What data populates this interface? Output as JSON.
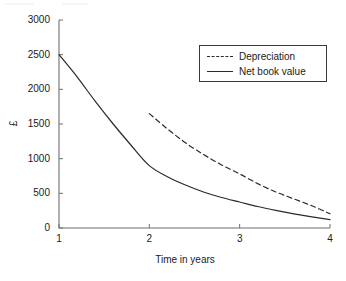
{
  "chart_data": {
    "type": "line",
    "title": "",
    "xlabel": "Time in years",
    "ylabel": "£",
    "xlim": [
      1,
      4
    ],
    "ylim": [
      0,
      3000
    ],
    "ytick_labels": [
      "0",
      "500",
      "1000",
      "1500",
      "2000",
      "2500",
      "3000"
    ],
    "ytick_values": [
      0,
      500,
      1000,
      1500,
      2000,
      2500,
      3000
    ],
    "xtick_labels": [
      "1",
      "2",
      "3",
      "4"
    ],
    "xtick_values": [
      1,
      2,
      3,
      4
    ],
    "grid": false,
    "legend_position": "upper right",
    "series": [
      {
        "name": "Depreciation",
        "style": "dashed",
        "color": "#2b2b2b",
        "x": [
          2,
          2.2,
          2.4,
          2.6,
          2.8,
          3,
          3.2,
          3.4,
          3.6,
          3.8,
          4
        ],
        "values": [
          1650,
          1430,
          1230,
          1060,
          910,
          780,
          640,
          520,
          420,
          320,
          205
        ]
      },
      {
        "name": "Net book value",
        "style": "solid",
        "color": "#2b2b2b",
        "x": [
          1,
          1.2,
          1.4,
          1.6,
          1.8,
          2,
          2.2,
          2.4,
          2.6,
          2.8,
          3,
          3.2,
          3.4,
          3.6,
          3.8,
          4
        ],
        "values": [
          2500,
          2180,
          1830,
          1500,
          1190,
          900,
          740,
          620,
          520,
          440,
          375,
          310,
          255,
          205,
          160,
          120
        ]
      }
    ],
    "legend_entries": [
      {
        "label": "Depreciation",
        "style": "dashed"
      },
      {
        "label": "Net book value",
        "style": "solid"
      }
    ]
  }
}
